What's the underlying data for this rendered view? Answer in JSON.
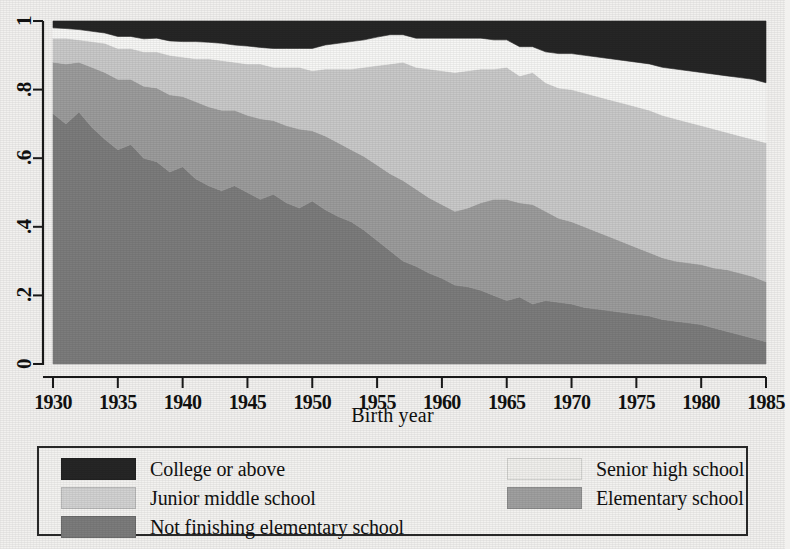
{
  "chart_data": {
    "type": "area",
    "stacked": true,
    "title": "",
    "xlabel": "Birth year",
    "ylabel": "",
    "xlim": [
      1930,
      1985
    ],
    "ylim": [
      0,
      1
    ],
    "grid": false,
    "legend_position": "bottom",
    "xticks": [
      1930,
      1935,
      1940,
      1945,
      1950,
      1955,
      1960,
      1965,
      1970,
      1975,
      1980,
      1985
    ],
    "xticklabels": [
      "1930",
      "1935",
      "1940",
      "1945",
      "1950",
      "1955",
      "1960",
      "1965",
      "1970",
      "1975",
      "1980",
      "1985"
    ],
    "yticks": [
      0,
      0.2,
      0.4,
      0.6,
      0.8,
      1
    ],
    "yticklabels": [
      "0",
      ".2",
      ".4",
      ".6",
      ".8",
      "1"
    ],
    "x": [
      1930,
      1931,
      1932,
      1933,
      1934,
      1935,
      1936,
      1937,
      1938,
      1939,
      1940,
      1941,
      1942,
      1943,
      1944,
      1945,
      1946,
      1947,
      1948,
      1949,
      1950,
      1951,
      1952,
      1953,
      1954,
      1955,
      1956,
      1957,
      1958,
      1959,
      1960,
      1961,
      1962,
      1963,
      1964,
      1965,
      1966,
      1967,
      1968,
      1969,
      1970,
      1971,
      1972,
      1973,
      1974,
      1975,
      1976,
      1977,
      1978,
      1979,
      1980,
      1981,
      1982,
      1983,
      1984,
      1985
    ],
    "stack_order_bottom_to_top": [
      "Not finishing elementary school",
      "Elementary school",
      "Junior middle school",
      "Senior high school",
      "College or above"
    ],
    "series": [
      {
        "name": "Not finishing elementary school",
        "color": "#7c7c7c",
        "values": [
          0.73,
          0.7,
          0.735,
          0.69,
          0.655,
          0.625,
          0.64,
          0.6,
          0.59,
          0.56,
          0.575,
          0.54,
          0.52,
          0.505,
          0.52,
          0.5,
          0.48,
          0.495,
          0.47,
          0.455,
          0.475,
          0.45,
          0.43,
          0.415,
          0.39,
          0.36,
          0.33,
          0.3,
          0.285,
          0.265,
          0.25,
          0.23,
          0.225,
          0.215,
          0.2,
          0.185,
          0.195,
          0.175,
          0.185,
          0.18,
          0.175,
          0.165,
          0.16,
          0.155,
          0.15,
          0.145,
          0.14,
          0.13,
          0.125,
          0.12,
          0.115,
          0.105,
          0.095,
          0.085,
          0.075,
          0.065
        ]
      },
      {
        "name": "Elementary school",
        "color": "#9c9c9c",
        "values": [
          0.15,
          0.175,
          0.145,
          0.175,
          0.195,
          0.205,
          0.19,
          0.21,
          0.215,
          0.225,
          0.205,
          0.225,
          0.23,
          0.235,
          0.22,
          0.225,
          0.235,
          0.215,
          0.225,
          0.23,
          0.205,
          0.215,
          0.215,
          0.21,
          0.215,
          0.22,
          0.225,
          0.235,
          0.225,
          0.22,
          0.215,
          0.215,
          0.23,
          0.255,
          0.28,
          0.295,
          0.275,
          0.29,
          0.26,
          0.245,
          0.24,
          0.235,
          0.225,
          0.215,
          0.205,
          0.195,
          0.185,
          0.18,
          0.175,
          0.175,
          0.175,
          0.175,
          0.18,
          0.18,
          0.18,
          0.175
        ]
      },
      {
        "name": "Junior middle school",
        "color": "#c9c9c9",
        "values": [
          0.07,
          0.075,
          0.065,
          0.075,
          0.085,
          0.09,
          0.09,
          0.1,
          0.105,
          0.115,
          0.115,
          0.125,
          0.14,
          0.145,
          0.14,
          0.15,
          0.16,
          0.155,
          0.17,
          0.18,
          0.175,
          0.195,
          0.215,
          0.235,
          0.26,
          0.29,
          0.32,
          0.345,
          0.355,
          0.375,
          0.39,
          0.405,
          0.4,
          0.39,
          0.38,
          0.385,
          0.37,
          0.385,
          0.375,
          0.38,
          0.385,
          0.39,
          0.395,
          0.4,
          0.405,
          0.41,
          0.415,
          0.415,
          0.415,
          0.41,
          0.405,
          0.405,
          0.4,
          0.4,
          0.4,
          0.405
        ]
      },
      {
        "name": "Senior high school",
        "color": "#f7f7f5",
        "values": [
          0.03,
          0.028,
          0.03,
          0.03,
          0.03,
          0.035,
          0.035,
          0.038,
          0.04,
          0.042,
          0.045,
          0.05,
          0.048,
          0.05,
          0.05,
          0.052,
          0.048,
          0.055,
          0.055,
          0.055,
          0.065,
          0.07,
          0.075,
          0.08,
          0.08,
          0.083,
          0.085,
          0.08,
          0.085,
          0.09,
          0.095,
          0.1,
          0.095,
          0.09,
          0.085,
          0.08,
          0.085,
          0.075,
          0.09,
          0.1,
          0.105,
          0.11,
          0.115,
          0.12,
          0.125,
          0.13,
          0.135,
          0.14,
          0.145,
          0.15,
          0.155,
          0.16,
          0.165,
          0.17,
          0.175,
          0.175
        ]
      },
      {
        "name": "College or above",
        "color": "#262626",
        "values": [
          0.02,
          0.022,
          0.025,
          0.03,
          0.035,
          0.045,
          0.045,
          0.052,
          0.05,
          0.058,
          0.06,
          0.06,
          0.062,
          0.065,
          0.07,
          0.073,
          0.077,
          0.08,
          0.08,
          0.08,
          0.08,
          0.07,
          0.065,
          0.06,
          0.055,
          0.047,
          0.04,
          0.04,
          0.05,
          0.05,
          0.05,
          0.05,
          0.05,
          0.05,
          0.055,
          0.055,
          0.075,
          0.075,
          0.09,
          0.095,
          0.095,
          0.1,
          0.105,
          0.11,
          0.115,
          0.12,
          0.125,
          0.135,
          0.14,
          0.145,
          0.15,
          0.155,
          0.16,
          0.165,
          0.17,
          0.18
        ]
      }
    ]
  },
  "legend": {
    "items": [
      {
        "label": "College or above",
        "color": "#262626",
        "column": 0,
        "row": 0
      },
      {
        "label": "Senior high school",
        "color": "#f0efec",
        "column": 1,
        "row": 0
      },
      {
        "label": "Junior middle school",
        "color": "#d2d2d2",
        "column": 0,
        "row": 1
      },
      {
        "label": "Elementary school",
        "color": "#a0a0a0",
        "column": 1,
        "row": 1
      },
      {
        "label": "Not finishing elementary school",
        "color": "#7c7c7c",
        "column": 0,
        "row": 2
      }
    ]
  }
}
